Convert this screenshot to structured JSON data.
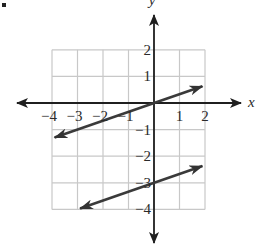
{
  "chart_data": {
    "type": "line",
    "title": "",
    "xlabel": "x",
    "ylabel": "y",
    "xlim": [
      -4,
      2
    ],
    "ylim": [
      -4,
      2
    ],
    "grid": true,
    "x_ticks": [
      -4,
      -3,
      -2,
      -1,
      1,
      2
    ],
    "x_tick_labels": [
      "−4",
      "−3",
      "−2",
      "−1",
      "1",
      "2"
    ],
    "y_ticks": [
      2,
      1,
      -1,
      -2,
      -3,
      -4
    ],
    "y_tick_labels": [
      "2",
      "1",
      "−1",
      "−2",
      "−3",
      "−4"
    ],
    "series": [
      {
        "name": "upper line",
        "equation": "y = x/3",
        "slope": 0.3333,
        "intercept": 0,
        "x": [
          -3.9,
          1.9
        ],
        "y": [
          -1.3,
          0.63
        ],
        "arrows": "both"
      },
      {
        "name": "lower line",
        "equation": "y = x/3 - 3",
        "slope": 0.3333,
        "intercept": -3,
        "x": [
          -2.9,
          1.9
        ],
        "y": [
          -3.97,
          -2.37
        ],
        "arrows": "both"
      }
    ],
    "colors": {
      "axis": "#1f1f1f",
      "grid": "#c8c8c8",
      "line": "#3a3a3a",
      "text": "#2a2a2a"
    }
  }
}
